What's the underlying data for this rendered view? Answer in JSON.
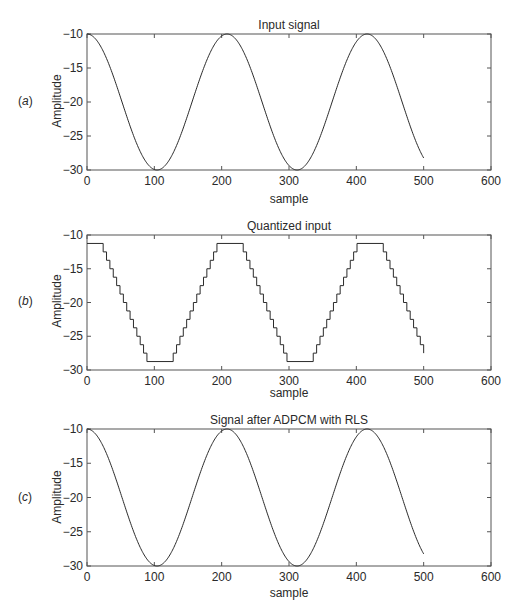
{
  "chart_data": [
    {
      "type": "line",
      "panel_tag": "a",
      "title": "Input signal",
      "xlabel": "sample",
      "ylabel": "Amplitude",
      "xlim": [
        0,
        600
      ],
      "ylim": [
        -30,
        -10
      ],
      "xticks": [
        0,
        100,
        200,
        300,
        400,
        500,
        600
      ],
      "yticks": [
        -10,
        -15,
        -20,
        -25,
        -30
      ],
      "grid": false,
      "series": [
        {
          "name": "input",
          "kind": "sinusoid",
          "x_range": [
            0,
            500
          ],
          "offset": -20,
          "amplitude": 10,
          "period": 208,
          "phase": "cos",
          "x": [
            0,
            52,
            104,
            156,
            208,
            260,
            312,
            364,
            416,
            468,
            500
          ],
          "values": [
            -10,
            -20,
            -30,
            -20,
            -10,
            -20,
            -30,
            -20,
            -10,
            -20,
            -27.9
          ]
        }
      ]
    },
    {
      "type": "line",
      "panel_tag": "b",
      "title": "Quantized input",
      "xlabel": "sample",
      "ylabel": "Amplitude",
      "xlim": [
        0,
        600
      ],
      "ylim": [
        -30,
        -10
      ],
      "xticks": [
        0,
        100,
        200,
        300,
        400,
        500,
        600
      ],
      "yticks": [
        -10,
        -15,
        -20,
        -25,
        -30
      ],
      "grid": false,
      "series": [
        {
          "name": "quantized",
          "kind": "staircase",
          "x_range": [
            0,
            500
          ],
          "period": 208,
          "max_level": -11.25,
          "min_level": -28.75,
          "step": 1.25,
          "plateau_width": 33,
          "x": [
            0,
            20,
            92,
            125,
            197,
            230,
            300,
            333,
            405,
            437,
            500
          ],
          "values": [
            -11.25,
            -11.25,
            -28.75,
            -28.75,
            -11.25,
            -11.25,
            -28.75,
            -28.75,
            -11.25,
            -11.25,
            -27.5
          ]
        }
      ]
    },
    {
      "type": "line",
      "panel_tag": "c",
      "title": "Signal after ADPCM with RLS",
      "xlabel": "sample",
      "ylabel": "Amplitude",
      "xlim": [
        0,
        600
      ],
      "ylim": [
        -30,
        -10
      ],
      "xticks": [
        0,
        100,
        200,
        300,
        400,
        500,
        600
      ],
      "yticks": [
        -10,
        -15,
        -20,
        -25,
        -30
      ],
      "grid": false,
      "series": [
        {
          "name": "reconstructed",
          "kind": "sinusoid",
          "x_range": [
            0,
            500
          ],
          "offset": -20,
          "amplitude": 10,
          "period": 208,
          "phase": "cos",
          "x": [
            0,
            52,
            104,
            156,
            208,
            260,
            312,
            364,
            416,
            468,
            500
          ],
          "values": [
            -10,
            -20,
            -30,
            -20,
            -10,
            -20,
            -30,
            -20,
            -10,
            -20,
            -27.9
          ]
        }
      ]
    }
  ],
  "panels": [
    {
      "tag": "a",
      "title": "Input signal",
      "xlabel": "sample",
      "ylabel": "Amplitude"
    },
    {
      "tag": "b",
      "title": "Quantized input",
      "xlabel": "sample",
      "ylabel": "Amplitude"
    },
    {
      "tag": "c",
      "title": "Signal after ADPCM with RLS",
      "xlabel": "sample",
      "ylabel": "Amplitude"
    }
  ],
  "colors": {
    "line": "#2a2a2a",
    "axes": "#555555",
    "background": "#ffffff"
  }
}
